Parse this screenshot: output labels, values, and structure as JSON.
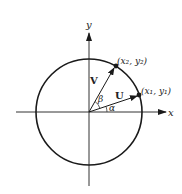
{
  "diagram": {
    "type": "unit-circle-vectors",
    "colors": {
      "stroke": "#1a1a1a",
      "axis": "#333333",
      "background": "#ffffff"
    },
    "axes": {
      "x_label": "x",
      "y_label": "y"
    },
    "circle": {
      "center": [
        89,
        112
      ],
      "radius": 53
    },
    "vectors": [
      {
        "name": "U",
        "label": "U",
        "angle_label": "α",
        "angle_deg": 18,
        "endpoint_label": "(x₁, y₁)"
      },
      {
        "name": "V",
        "label": "V",
        "angle_label": "β",
        "angle_deg": 60,
        "endpoint_label": "(x₂, y₂)"
      }
    ]
  }
}
